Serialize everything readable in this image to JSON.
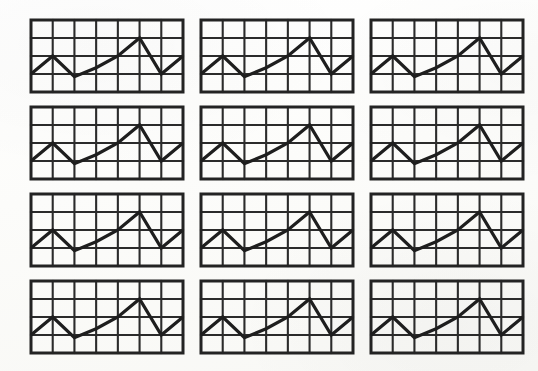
{
  "page": {
    "background_color": "#fdfdfb",
    "ink_color": "#1e1e1e",
    "layout_rows": 4,
    "layout_columns": 3,
    "thumbnail_count": 12
  },
  "chart_data": {
    "type": "line",
    "title": "",
    "subtitle": "",
    "xlabel": "",
    "ylabel": "",
    "grid": true,
    "legend": null,
    "legend_position": "none",
    "grid_columns": 7,
    "grid_rows": 4,
    "xlim": [
      0,
      7
    ],
    "ylim": [
      0,
      4
    ],
    "x": [
      0,
      1,
      2,
      3,
      4,
      5,
      6,
      7
    ],
    "values": [
      1.0,
      2.0,
      0.85,
      1.35,
      2.0,
      3.0,
      1.0,
      2.0
    ],
    "categories": [
      "0",
      "1",
      "2",
      "3",
      "4",
      "5",
      "6",
      "7"
    ],
    "repeated_identical_panels": 12,
    "panels": [
      {
        "id": 1,
        "row": 1,
        "col": 1,
        "values": [
          1.0,
          2.0,
          0.85,
          1.35,
          2.0,
          3.0,
          1.0,
          2.0
        ]
      },
      {
        "id": 2,
        "row": 1,
        "col": 2,
        "values": [
          1.0,
          2.0,
          0.85,
          1.35,
          2.0,
          3.0,
          1.0,
          2.0
        ]
      },
      {
        "id": 3,
        "row": 1,
        "col": 3,
        "values": [
          1.0,
          2.0,
          0.85,
          1.35,
          2.0,
          3.0,
          1.0,
          2.0
        ]
      },
      {
        "id": 4,
        "row": 2,
        "col": 1,
        "values": [
          1.0,
          2.0,
          0.85,
          1.35,
          2.0,
          3.0,
          1.0,
          2.0
        ]
      },
      {
        "id": 5,
        "row": 2,
        "col": 2,
        "values": [
          1.0,
          2.0,
          0.85,
          1.35,
          2.0,
          3.0,
          1.0,
          2.0
        ]
      },
      {
        "id": 6,
        "row": 2,
        "col": 3,
        "values": [
          1.0,
          2.0,
          0.85,
          1.35,
          2.0,
          3.0,
          1.0,
          2.0
        ]
      },
      {
        "id": 7,
        "row": 3,
        "col": 1,
        "values": [
          1.0,
          2.0,
          0.85,
          1.35,
          2.0,
          3.0,
          1.0,
          2.0
        ]
      },
      {
        "id": 8,
        "row": 3,
        "col": 2,
        "values": [
          1.0,
          2.0,
          0.85,
          1.35,
          2.0,
          3.0,
          1.0,
          2.0
        ]
      },
      {
        "id": 9,
        "row": 3,
        "col": 3,
        "values": [
          1.0,
          2.0,
          0.85,
          1.35,
          2.0,
          3.0,
          1.0,
          2.0
        ]
      },
      {
        "id": 10,
        "row": 4,
        "col": 1,
        "values": [
          1.0,
          2.0,
          0.85,
          1.35,
          2.0,
          3.0,
          1.0,
          2.0
        ]
      },
      {
        "id": 11,
        "row": 4,
        "col": 2,
        "values": [
          1.0,
          2.0,
          0.85,
          1.35,
          2.0,
          3.0,
          1.0,
          2.0
        ]
      },
      {
        "id": 12,
        "row": 4,
        "col": 3,
        "values": [
          1.0,
          2.0,
          0.85,
          1.35,
          2.0,
          3.0,
          1.0,
          2.0
        ]
      }
    ]
  }
}
